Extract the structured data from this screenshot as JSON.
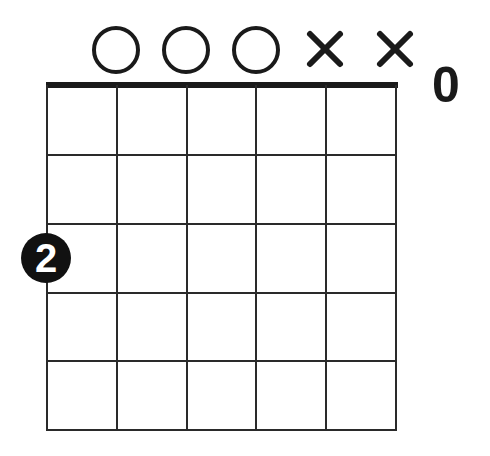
{
  "diagram": {
    "type": "guitar-chord-chart",
    "strings": 6,
    "frets_shown": 5,
    "start_fret_label": "0",
    "colors": {
      "background": "#ffffff",
      "ink": "#1a1a1a",
      "finger_text": "#ffffff"
    },
    "open_muted_markers": [
      {
        "string": 1,
        "marker": "none"
      },
      {
        "string": 2,
        "marker": "open",
        "icon": "open-circle-icon"
      },
      {
        "string": 3,
        "marker": "open",
        "icon": "open-circle-icon"
      },
      {
        "string": 4,
        "marker": "open",
        "icon": "open-circle-icon"
      },
      {
        "string": 5,
        "marker": "muted",
        "icon": "x-mute-icon"
      },
      {
        "string": 6,
        "marker": "muted",
        "icon": "x-mute-icon"
      }
    ],
    "fingers": [
      {
        "string": 1,
        "fret_line": 2,
        "finger": "2"
      }
    ]
  }
}
